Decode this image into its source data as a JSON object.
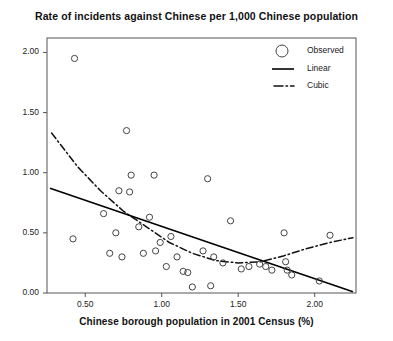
{
  "chart_data": {
    "type": "scatter",
    "title": "Rate of incidents against Chinese per 1,000 Chinese population",
    "xlabel": "Chinese borough population in 2001 Census (%)",
    "ylabel": "",
    "xlim": [
      0.25,
      2.27
    ],
    "ylim": [
      0.0,
      2.12
    ],
    "xticks": [
      0.5,
      1.0,
      1.5,
      2.0
    ],
    "xtick_labels": [
      "0.50",
      "1.00",
      "1.50",
      "2.00"
    ],
    "yticks": [
      0.0,
      0.5,
      1.0,
      1.5,
      2.0
    ],
    "ytick_labels": [
      "0.00",
      "0.50",
      "1.00",
      "1.50",
      "2.00"
    ],
    "grid": false,
    "legend_position": "top-right",
    "series": [
      {
        "name": "Observed",
        "type": "scatter",
        "marker": "open-circle",
        "points": [
          [
            0.43,
            1.95
          ],
          [
            0.77,
            1.35
          ],
          [
            0.42,
            0.45
          ],
          [
            0.62,
            0.66
          ],
          [
            0.66,
            0.33
          ],
          [
            0.7,
            0.5
          ],
          [
            0.72,
            0.85
          ],
          [
            0.74,
            0.3
          ],
          [
            0.79,
            0.84
          ],
          [
            0.8,
            0.98
          ],
          [
            0.85,
            0.55
          ],
          [
            0.88,
            0.33
          ],
          [
            0.95,
            0.98
          ],
          [
            0.92,
            0.63
          ],
          [
            0.96,
            0.35
          ],
          [
            0.99,
            0.42
          ],
          [
            1.03,
            0.22
          ],
          [
            1.06,
            0.47
          ],
          [
            1.1,
            0.3
          ],
          [
            1.14,
            0.18
          ],
          [
            1.17,
            0.17
          ],
          [
            1.2,
            0.05
          ],
          [
            1.27,
            0.35
          ],
          [
            1.3,
            0.95
          ],
          [
            1.32,
            0.06
          ],
          [
            1.34,
            0.3
          ],
          [
            1.4,
            0.25
          ],
          [
            1.45,
            0.6
          ],
          [
            1.52,
            0.2
          ],
          [
            1.57,
            0.22
          ],
          [
            1.64,
            0.24
          ],
          [
            1.68,
            0.22
          ],
          [
            1.72,
            0.19
          ],
          [
            1.8,
            0.5
          ],
          [
            1.81,
            0.26
          ],
          [
            1.82,
            0.19
          ],
          [
            1.85,
            0.15
          ],
          [
            2.03,
            0.1
          ],
          [
            2.1,
            0.48
          ]
        ]
      },
      {
        "name": "Linear",
        "type": "line",
        "style": "solid",
        "points": [
          [
            0.27,
            0.87
          ],
          [
            2.25,
            0.01
          ]
        ]
      },
      {
        "name": "Cubic",
        "type": "line",
        "style": "dash-dot",
        "points": [
          [
            0.28,
            1.33
          ],
          [
            0.45,
            1.05
          ],
          [
            0.6,
            0.85
          ],
          [
            0.75,
            0.68
          ],
          [
            0.9,
            0.55
          ],
          [
            1.05,
            0.42
          ],
          [
            1.2,
            0.33
          ],
          [
            1.35,
            0.27
          ],
          [
            1.5,
            0.25
          ],
          [
            1.65,
            0.26
          ],
          [
            1.8,
            0.31
          ],
          [
            1.95,
            0.37
          ],
          [
            2.1,
            0.42
          ],
          [
            2.25,
            0.46
          ]
        ]
      }
    ],
    "legend": [
      {
        "label": "Observed",
        "marker": "open-circle"
      },
      {
        "label": "Linear",
        "marker": "solid-line"
      },
      {
        "label": "Cubic",
        "marker": "dash-dot-line"
      }
    ],
    "colors": {
      "axis": "#555555",
      "marker": "#444444",
      "linear": "#000000",
      "cubic": "#111111",
      "text": "#111111",
      "background": "#ffffff"
    }
  }
}
